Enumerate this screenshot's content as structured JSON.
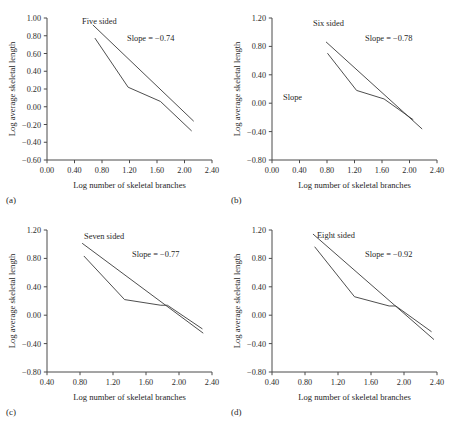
{
  "figure": {
    "axis_titles": {
      "x": "Log number of skeletal branches",
      "y": "Log average skeletal length"
    }
  },
  "chart_data": [
    {
      "type": "line",
      "panel_label": "(a)",
      "title": "Five sided",
      "annotation": "Slope = −0.74",
      "extra_annotation": "",
      "xlabel": "Log number of skeletal branches",
      "ylabel": "Log average skeletal length",
      "xlim": [
        0.0,
        2.4
      ],
      "ylim": [
        -0.6,
        1.0
      ],
      "xticks": [
        "0.00",
        "0.40",
        "0.80",
        "1.20",
        "1.60",
        "2.00",
        "2.40"
      ],
      "yticks": [
        "1.00",
        "0.80",
        "0.60",
        "0.40",
        "0.20",
        "0.00",
        "-0.20",
        "-0.40",
        "-0.60"
      ],
      "grid": false,
      "legend": "none",
      "series": [
        {
          "name": "data",
          "x": [
            0.7,
            1.18,
            1.65,
            2.1
          ],
          "y": [
            0.77,
            0.22,
            0.06,
            -0.27
          ]
        },
        {
          "name": "fit",
          "slope": -0.74,
          "x": [
            0.67,
            2.13
          ],
          "y": [
            0.92,
            -0.16
          ]
        }
      ]
    },
    {
      "type": "line",
      "panel_label": "(b)",
      "title": "Six sided",
      "annotation": "Slope = −0.78",
      "extra_annotation": "Slope",
      "xlabel": "Log number of skeletal branches",
      "ylabel": "Log average skeletal length",
      "xlim": [
        0.0,
        2.4
      ],
      "ylim": [
        -0.8,
        1.2
      ],
      "xticks": [
        "0.00",
        "0.40",
        "0.80",
        "1.20",
        "1.60",
        "2.00",
        "2.40"
      ],
      "yticks": [
        "1.20",
        "0.80",
        "0.40",
        "0.00",
        "-0.40",
        "-0.80"
      ],
      "grid": false,
      "legend": "none",
      "series": [
        {
          "name": "data",
          "x": [
            0.81,
            1.23,
            1.63,
            2.05
          ],
          "y": [
            0.7,
            0.18,
            0.06,
            -0.23
          ]
        },
        {
          "name": "fit",
          "slope": -0.78,
          "x": [
            0.79,
            2.18
          ],
          "y": [
            0.86,
            -0.36
          ]
        }
      ]
    },
    {
      "type": "line",
      "panel_label": "(c)",
      "title": "Seven sided",
      "annotation": "Slope = −0.77",
      "extra_annotation": "",
      "xlabel": "Log number of skeletal branches",
      "ylabel": "Log average skeletal length",
      "xlim": [
        0.4,
        2.4
      ],
      "ylim": [
        -0.8,
        1.2
      ],
      "xticks": [
        "0.40",
        "0.80",
        "1.20",
        "1.60",
        "2.00",
        "2.40"
      ],
      "yticks": [
        "1.20",
        "0.80",
        "0.40",
        "0.00",
        "-0.40",
        "-0.80"
      ],
      "grid": false,
      "legend": "none",
      "series": [
        {
          "name": "data",
          "x": [
            0.85,
            1.34,
            1.78,
            1.86,
            2.28
          ],
          "y": [
            0.83,
            0.22,
            0.14,
            0.14,
            -0.19
          ]
        },
        {
          "name": "fit",
          "slope": -0.77,
          "x": [
            0.83,
            2.29
          ],
          "y": [
            1.01,
            -0.25
          ]
        }
      ]
    },
    {
      "type": "line",
      "panel_label": "(d)",
      "title": "Eight sided",
      "annotation": "Slope = −0.92",
      "extra_annotation": "",
      "xlabel": "Log number of skeletal branches",
      "ylabel": "Log average skeletal length",
      "xlim": [
        0.4,
        2.4
      ],
      "ylim": [
        -0.8,
        1.2
      ],
      "xticks": [
        "0.40",
        "0.80",
        "1.20",
        "1.60",
        "2.00",
        "2.40"
      ],
      "yticks": [
        "1.20",
        "0.80",
        "0.40",
        "0.00",
        "-0.40",
        "-0.80"
      ],
      "grid": false,
      "legend": "none",
      "series": [
        {
          "name": "data",
          "x": [
            0.92,
            1.4,
            1.82,
            1.9,
            2.33
          ],
          "y": [
            0.96,
            0.26,
            0.13,
            0.13,
            -0.23
          ]
        },
        {
          "name": "fit",
          "slope": -0.92,
          "x": [
            0.9,
            2.36
          ],
          "y": [
            1.14,
            -0.34
          ]
        }
      ]
    }
  ]
}
